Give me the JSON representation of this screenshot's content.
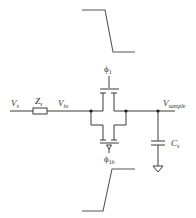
{
  "diagram": {
    "labels": {
      "source_voltage": "V",
      "source_voltage_sub": "s",
      "source_impedance": "Z",
      "source_impedance_sub": "s",
      "input_node": "V",
      "input_node_sub": "in",
      "output_node": "V",
      "output_node_sub": "sample",
      "sample_capacitor": "C",
      "sample_capacitor_sub": "s",
      "clock_phase": "ϕ",
      "clock_phase_sub": "1",
      "clock_phase_bar": "ϕ",
      "clock_phase_bar_sub": "1b"
    },
    "components": [
      {
        "id": "Zs",
        "type": "resistor",
        "label": "Zs"
      },
      {
        "id": "M_n",
        "type": "nmos",
        "gate": "ϕ1"
      },
      {
        "id": "M_p",
        "type": "pmos",
        "gate": "ϕ1b"
      },
      {
        "id": "Cs",
        "type": "capacitor",
        "label": "Cs"
      },
      {
        "id": "GND",
        "type": "ground"
      }
    ],
    "waveforms": [
      {
        "id": "phi1",
        "shape": "falling-edge",
        "position": "top"
      },
      {
        "id": "phi1b",
        "shape": "rising-edge",
        "position": "bottom"
      }
    ],
    "colors": {
      "wire": "#3a3a3a",
      "waveform": "#555555",
      "text": "#333333",
      "background": "#ffffff"
    }
  }
}
